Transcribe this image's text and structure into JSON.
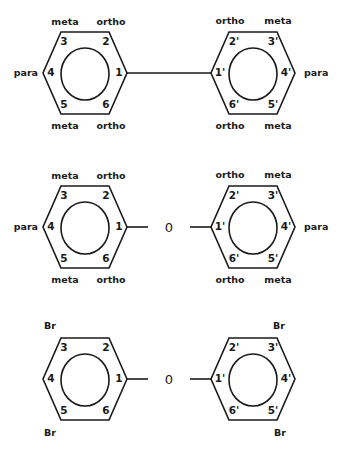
{
  "diagrams": [
    {
      "name": "biphenyl",
      "linker": "",
      "left_ring": {
        "numbers": [
          "1",
          "2",
          "3",
          "4",
          "5",
          "6"
        ],
        "labels": {
          "pos2": "ortho",
          "pos3": "meta",
          "pos4": "para",
          "pos5": "meta",
          "pos6": "ortho"
        }
      },
      "right_ring": {
        "numbers": [
          "1'",
          "2'",
          "3'",
          "4'",
          "5'",
          "6'"
        ],
        "labels": {
          "pos2": "ortho",
          "pos3": "meta",
          "pos4": "para",
          "pos5": "meta",
          "pos6": "ortho"
        }
      }
    },
    {
      "name": "diphenyl-ether",
      "linker": "0",
      "left_ring": {
        "numbers": [
          "1",
          "2",
          "3",
          "4",
          "5",
          "6"
        ],
        "labels": {
          "pos2": "ortho",
          "pos3": "meta",
          "pos4": "para",
          "pos5": "meta",
          "pos6": "ortho"
        }
      },
      "right_ring": {
        "numbers": [
          "1'",
          "2'",
          "3'",
          "4'",
          "5'",
          "6'"
        ],
        "labels": {
          "pos2": "ortho",
          "pos3": "meta",
          "pos4": "para",
          "pos5": "meta",
          "pos6": "ortho"
        }
      }
    },
    {
      "name": "tetrabromodiphenyl-ether",
      "linker": "0",
      "left_ring": {
        "numbers": [
          "1",
          "2",
          "3",
          "4",
          "5",
          "6"
        ],
        "labels": {
          "pos3": "Br",
          "pos5": "Br"
        }
      },
      "right_ring": {
        "numbers": [
          "1'",
          "2'",
          "3'",
          "4'",
          "5'",
          "6'"
        ],
        "labels": {
          "pos3": "Br",
          "pos5": "Br"
        }
      }
    }
  ]
}
